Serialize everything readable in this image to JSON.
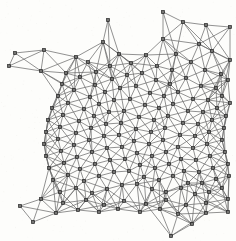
{
  "figure": {
    "type": "graph-mesh",
    "width": 236,
    "height": 241,
    "background_color": "#fdfdfb",
    "edge_color": "#6e6e6e",
    "node_fill_color": "#2b2b2b",
    "node_inner_color": "#f5f5f0",
    "node_marker": "small-square",
    "node_size_px": 3.4,
    "edge_width_px": 0.75,
    "node_count": 168,
    "edge_count": 452,
    "caption": ""
  },
  "chart_data": {
    "type": "scatter",
    "xlabel": "",
    "ylabel": "",
    "xlim": [
      0,
      236
    ],
    "ylim": [
      0,
      241
    ],
    "grid": false,
    "legend": null,
    "nodes": [
      [
        108,
        20
      ],
      [
        163,
        12
      ],
      [
        103,
        42
      ],
      [
        163,
        39
      ],
      [
        15,
        53
      ],
      [
        44,
        50
      ],
      [
        76,
        57
      ],
      [
        9,
        66
      ],
      [
        41,
        71
      ],
      [
        66,
        73
      ],
      [
        88,
        62
      ],
      [
        119,
        54
      ],
      [
        146,
        55
      ],
      [
        176,
        54
      ],
      [
        199,
        44
      ],
      [
        206,
        25
      ],
      [
        230,
        27
      ],
      [
        212,
        51
      ],
      [
        230,
        60
      ],
      [
        183,
        22
      ],
      [
        96,
        72
      ],
      [
        110,
        66
      ],
      [
        131,
        63
      ],
      [
        157,
        66
      ],
      [
        172,
        70
      ],
      [
        191,
        62
      ],
      [
        205,
        70
      ],
      [
        221,
        74
      ],
      [
        62,
        84
      ],
      [
        80,
        77
      ],
      [
        95,
        85
      ],
      [
        112,
        79
      ],
      [
        127,
        75
      ],
      [
        142,
        73
      ],
      [
        156,
        80
      ],
      [
        170,
        84
      ],
      [
        186,
        78
      ],
      [
        201,
        86
      ],
      [
        216,
        88
      ],
      [
        228,
        80
      ],
      [
        58,
        96
      ],
      [
        74,
        90
      ],
      [
        90,
        97
      ],
      [
        105,
        92
      ],
      [
        120,
        88
      ],
      [
        136,
        86
      ],
      [
        150,
        93
      ],
      [
        164,
        96
      ],
      [
        178,
        92
      ],
      [
        193,
        99
      ],
      [
        208,
        100
      ],
      [
        222,
        96
      ],
      [
        52,
        108
      ],
      [
        68,
        103
      ],
      [
        84,
        109
      ],
      [
        99,
        104
      ],
      [
        114,
        100
      ],
      [
        130,
        99
      ],
      [
        145,
        105
      ],
      [
        159,
        108
      ],
      [
        173,
        104
      ],
      [
        188,
        111
      ],
      [
        203,
        112
      ],
      [
        217,
        108
      ],
      [
        230,
        103
      ],
      [
        48,
        120
      ],
      [
        63,
        115
      ],
      [
        79,
        121
      ],
      [
        94,
        116
      ],
      [
        109,
        112
      ],
      [
        124,
        111
      ],
      [
        139,
        117
      ],
      [
        154,
        120
      ],
      [
        168,
        116
      ],
      [
        183,
        123
      ],
      [
        198,
        124
      ],
      [
        212,
        120
      ],
      [
        226,
        116
      ],
      [
        46,
        132
      ],
      [
        60,
        127
      ],
      [
        76,
        133
      ],
      [
        91,
        128
      ],
      [
        106,
        124
      ],
      [
        121,
        123
      ],
      [
        136,
        129
      ],
      [
        151,
        132
      ],
      [
        165,
        128
      ],
      [
        180,
        135
      ],
      [
        195,
        136
      ],
      [
        209,
        132
      ],
      [
        224,
        128
      ],
      [
        44,
        144
      ],
      [
        58,
        139
      ],
      [
        74,
        145
      ],
      [
        89,
        140
      ],
      [
        104,
        136
      ],
      [
        119,
        135
      ],
      [
        134,
        141
      ],
      [
        149,
        144
      ],
      [
        163,
        140
      ],
      [
        178,
        147
      ],
      [
        193,
        148
      ],
      [
        207,
        144
      ],
      [
        222,
        140
      ],
      [
        46,
        156
      ],
      [
        61,
        151
      ],
      [
        77,
        157
      ],
      [
        92,
        152
      ],
      [
        107,
        148
      ],
      [
        122,
        147
      ],
      [
        137,
        153
      ],
      [
        152,
        156
      ],
      [
        166,
        152
      ],
      [
        181,
        159
      ],
      [
        196,
        160
      ],
      [
        210,
        156
      ],
      [
        225,
        152
      ],
      [
        49,
        168
      ],
      [
        64,
        163
      ],
      [
        80,
        169
      ],
      [
        95,
        164
      ],
      [
        110,
        160
      ],
      [
        125,
        159
      ],
      [
        140,
        165
      ],
      [
        155,
        168
      ],
      [
        169,
        164
      ],
      [
        184,
        171
      ],
      [
        199,
        172
      ],
      [
        213,
        168
      ],
      [
        228,
        164
      ],
      [
        53,
        180
      ],
      [
        68,
        175
      ],
      [
        84,
        181
      ],
      [
        99,
        176
      ],
      [
        114,
        172
      ],
      [
        129,
        171
      ],
      [
        144,
        177
      ],
      [
        159,
        180
      ],
      [
        173,
        176
      ],
      [
        188,
        183
      ],
      [
        202,
        183
      ],
      [
        216,
        179
      ],
      [
        229,
        176
      ],
      [
        60,
        192
      ],
      [
        76,
        188
      ],
      [
        92,
        193
      ],
      [
        107,
        189
      ],
      [
        122,
        185
      ],
      [
        137,
        184
      ],
      [
        152,
        189
      ],
      [
        166,
        192
      ],
      [
        181,
        188
      ],
      [
        195,
        194
      ],
      [
        209,
        192
      ],
      [
        222,
        188
      ],
      [
        20,
        206
      ],
      [
        41,
        199
      ],
      [
        63,
        203
      ],
      [
        86,
        200
      ],
      [
        104,
        205
      ],
      [
        124,
        201
      ],
      [
        146,
        204
      ],
      [
        166,
        200
      ],
      [
        186,
        205
      ],
      [
        206,
        203
      ],
      [
        228,
        199
      ],
      [
        33,
        222
      ],
      [
        56,
        213
      ],
      [
        78,
        210
      ],
      [
        99,
        212
      ],
      [
        118,
        209
      ],
      [
        140,
        212
      ],
      [
        160,
        209
      ],
      [
        178,
        214
      ],
      [
        192,
        224
      ],
      [
        206,
        213
      ],
      [
        228,
        212
      ],
      [
        171,
        236
      ]
    ],
    "edges_note": "Edges form a Delaunay triangulation over the node set; long thin triangles connect the ragged boundary outliers to the dense interior lattice."
  }
}
